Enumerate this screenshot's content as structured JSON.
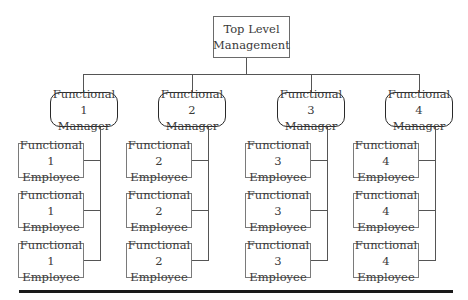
{
  "diagram": {
    "type": "functional-organization-chart",
    "top": {
      "line1": "Top Level",
      "line2": "Management"
    },
    "functions": [
      {
        "manager": {
          "line1": "Functional 1",
          "line2": "Manager"
        },
        "employees": [
          {
            "line1": "Functional 1",
            "line2": "Employee"
          },
          {
            "line1": "Functional 1",
            "line2": "Employee"
          },
          {
            "line1": "Functional 1",
            "line2": "Employee"
          }
        ]
      },
      {
        "manager": {
          "line1": "Functional 2",
          "line2": "Manager"
        },
        "employees": [
          {
            "line1": "Functional 2",
            "line2": "Employee"
          },
          {
            "line1": "Functional 2",
            "line2": "Employee"
          },
          {
            "line1": "Functional 2",
            "line2": "Employee"
          }
        ]
      },
      {
        "manager": {
          "line1": "Functional 3",
          "line2": "Manager"
        },
        "employees": [
          {
            "line1": "Functional 3",
            "line2": "Employee"
          },
          {
            "line1": "Functional 3",
            "line2": "Employee"
          },
          {
            "line1": "Functional 3",
            "line2": "Employee"
          }
        ]
      },
      {
        "manager": {
          "line1": "Functional 4",
          "line2": "Manager"
        },
        "employees": [
          {
            "line1": "Functional 4",
            "line2": "Employee"
          },
          {
            "line1": "Functional 4",
            "line2": "Employee"
          },
          {
            "line1": "Functional 4",
            "line2": "Employee"
          }
        ]
      }
    ]
  }
}
